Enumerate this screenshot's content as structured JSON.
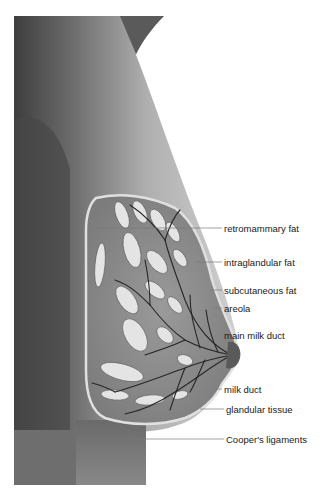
{
  "diagram": {
    "colors": {
      "background": "#ffffff",
      "body_skin": "#a8a8a8",
      "body_shadow": "#4a4a4a",
      "tissue": "#8f8f8f",
      "fat_lobules": "#e6e6e6",
      "ducts": "#2a2a2a",
      "leader_line": "#7a7a7a",
      "label_text": "#1a1a1a"
    },
    "labels": [
      {
        "id": "retromammary-fat",
        "text": "retromammary fat",
        "x": 224,
        "y": 224,
        "line_from_x": 96,
        "line_to_x": 222
      },
      {
        "id": "intraglandular-fat",
        "text": "intraglandular fat",
        "x": 224,
        "y": 258,
        "line_from_x": 196,
        "line_to_x": 222
      },
      {
        "id": "subcutaneous-fat",
        "text": "subcutaneous fat",
        "x": 224,
        "y": 286,
        "line_from_x": 210,
        "line_to_x": 222
      },
      {
        "id": "areola",
        "text": "areola",
        "x": 224,
        "y": 304,
        "line_from_x": 214,
        "line_to_x": 222
      },
      {
        "id": "main-milk-duct",
        "text": "main milk duct",
        "x": 224,
        "y": 331,
        "line_from_x": 220,
        "line_to_x": 222
      },
      {
        "id": "milk-duct",
        "text": "milk duct",
        "x": 224,
        "y": 385,
        "line_from_x": 214,
        "line_to_x": 222
      },
      {
        "id": "glandular-tissue",
        "text": "glandular tissue",
        "x": 226,
        "y": 405,
        "line_from_x": 200,
        "line_to_x": 224
      },
      {
        "id": "coopers-ligaments",
        "text": "Cooper's ligaments",
        "x": 226,
        "y": 435,
        "line_from_x": 130,
        "line_to_x": 224
      }
    ]
  }
}
